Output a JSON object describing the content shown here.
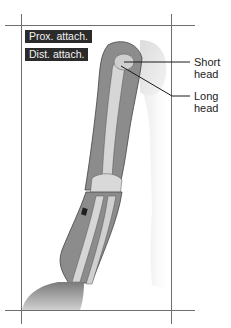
{
  "figure": {
    "colors": {
      "background": "#ffffff",
      "frame_line": "#6e6e6e",
      "button_bg": "#2b2b2b",
      "button_text": "#f2f2f2",
      "muscle": "#8c8c8c",
      "bone": "#d6d6d6",
      "skin_shadow": "#c8c8c8",
      "label_text": "#222222",
      "leader_line": "#1a1a1a"
    }
  },
  "buttons": {
    "proximal_attachment": {
      "label": "Prox. attach."
    },
    "distal_attachment": {
      "label": "Dist. attach."
    }
  },
  "callouts": [
    {
      "id": "short-head",
      "line1": "Short",
      "line2": "head"
    },
    {
      "id": "long-head",
      "line1": "Long",
      "line2": "head"
    }
  ]
}
